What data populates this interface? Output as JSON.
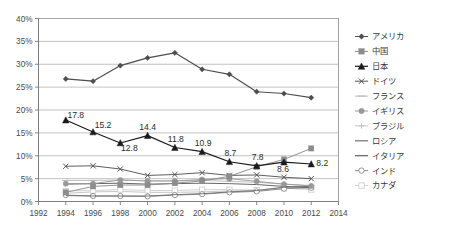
{
  "chart_data": {
    "type": "line",
    "title": "",
    "subtitle": "",
    "xlabel": "",
    "ylabel": "",
    "xlim": [
      1992,
      2014
    ],
    "ylim": [
      0,
      40
    ],
    "grid": true,
    "legend_position": "right",
    "x": [
      1994,
      1996,
      1998,
      2000,
      2002,
      2004,
      2006,
      2008,
      2010,
      2012
    ],
    "x_ticks": [
      "1992",
      "1994",
      "1996",
      "1998",
      "2000",
      "2002",
      "2004",
      "2006",
      "2008",
      "2010",
      "2012",
      "2014"
    ],
    "x_tick_values": [
      1992,
      1994,
      1996,
      1998,
      2000,
      2002,
      2004,
      2006,
      2008,
      2010,
      2012,
      2014
    ],
    "y_ticks": [
      "0%",
      "5%",
      "10%",
      "15%",
      "20%",
      "25%",
      "30%",
      "35%",
      "40%"
    ],
    "y_tick_values": [
      0,
      5,
      10,
      15,
      20,
      25,
      30,
      35,
      40
    ],
    "series": [
      {
        "name": "アメリカ",
        "marker": "diamond",
        "color": "#4d4d4d",
        "values": [
          26.8,
          26.3,
          29.7,
          31.4,
          32.5,
          28.9,
          27.8,
          24.0,
          23.6,
          22.7
        ]
      },
      {
        "name": "中国",
        "marker": "square",
        "color": "#8c8c8c",
        "values": [
          2.0,
          3.3,
          3.6,
          3.6,
          4.0,
          4.5,
          5.5,
          7.6,
          9.2,
          11.6
        ]
      },
      {
        "name": "日本",
        "marker": "triangle",
        "color": "#1a1a1a",
        "values": [
          17.8,
          15.2,
          12.8,
          14.4,
          11.8,
          10.9,
          8.7,
          7.8,
          8.6,
          8.2
        ],
        "labels": [
          "17.8",
          "15.2",
          "12.8",
          "14.4",
          "11.8",
          "10.9",
          "8.7",
          "7.8",
          "8.6",
          "8.2"
        ]
      },
      {
        "name": "ドイツ",
        "marker": "x",
        "color": "#555555",
        "values": [
          7.7,
          7.8,
          7.1,
          5.7,
          5.9,
          6.3,
          5.7,
          5.8,
          5.3,
          5.0
        ]
      },
      {
        "name": "フランス",
        "marker": "dash",
        "color": "#bdbdbd",
        "values": [
          4.6,
          4.6,
          4.7,
          4.5,
          4.5,
          4.6,
          4.4,
          4.2,
          3.8,
          3.5
        ]
      },
      {
        "name": "イギリス",
        "marker": "circle",
        "color": "#999999",
        "values": [
          3.9,
          3.9,
          4.7,
          4.5,
          4.5,
          4.8,
          5.0,
          4.4,
          3.8,
          3.4
        ]
      },
      {
        "name": "ブラジル",
        "marker": "plus",
        "color": "#c4c4c4",
        "values": [
          1.8,
          2.1,
          2.2,
          2.0,
          2.0,
          2.1,
          2.3,
          2.4,
          3.2,
          3.3
        ]
      },
      {
        "name": "ロシア",
        "marker": "none",
        "color": "#707070",
        "values": [
          1.3,
          1.2,
          1.2,
          1.2,
          1.5,
          1.7,
          2.1,
          2.4,
          3.1,
          3.3
        ]
      },
      {
        "name": "イタリア",
        "marker": "none",
        "color": "#5f5f5f",
        "values": [
          3.8,
          3.9,
          4.0,
          3.8,
          3.9,
          4.0,
          3.9,
          3.7,
          3.3,
          3.0
        ]
      },
      {
        "name": "インド",
        "marker": "open-circle",
        "color": "#8a8a8a",
        "values": [
          1.4,
          1.2,
          1.2,
          1.1,
          1.4,
          1.6,
          2.0,
          2.2,
          2.8,
          3.0
        ]
      },
      {
        "name": "カナダ",
        "marker": "open-square",
        "color": "#d0d0d0",
        "values": [
          2.3,
          2.4,
          2.6,
          2.4,
          2.4,
          2.6,
          2.6,
          2.5,
          2.9,
          2.6
        ]
      }
    ]
  }
}
